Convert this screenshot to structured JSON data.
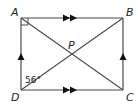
{
  "diagram": {
    "type": "rectangle-with-diagonals",
    "colors": {
      "line": "#4a4a4a",
      "text": "#222222",
      "background": "#ffffff"
    },
    "vertices": [
      {
        "name": "A",
        "x": 21,
        "y": 18
      },
      {
        "name": "B",
        "x": 123,
        "y": 18
      },
      {
        "name": "C",
        "x": 123,
        "y": 90
      },
      {
        "name": "D",
        "x": 21,
        "y": 90
      }
    ],
    "intersection": {
      "name": "P",
      "x": 72,
      "y": 54
    },
    "labels": {
      "A": "A",
      "B": "B",
      "C": "C",
      "D": "D",
      "P": "P",
      "angle_D": "56°"
    },
    "markings": {
      "right_angle_at": "A",
      "parallel_double_arrows": [
        "AB",
        "DC"
      ],
      "parallel_single_arrows": [
        "DA",
        "CB"
      ]
    }
  }
}
